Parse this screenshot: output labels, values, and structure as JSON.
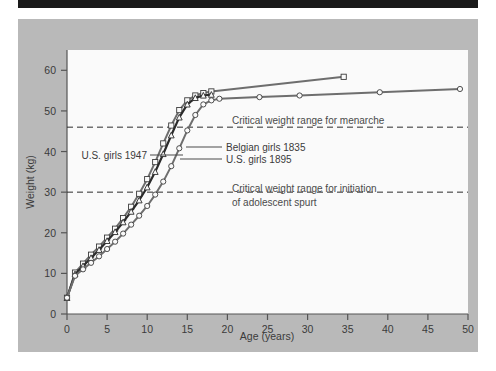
{
  "figure": {
    "background_color": "#b9b9b9",
    "plot_background_color": "#fafafa",
    "top_rule_color": "#1a1a1a"
  },
  "chart_data": {
    "type": "line",
    "title": "",
    "xlabel": "Age (years)",
    "ylabel": "Weight (kg)",
    "xlim": [
      0,
      50
    ],
    "ylim": [
      0,
      65
    ],
    "xticks": [
      0,
      5,
      10,
      15,
      20,
      25,
      30,
      35,
      40,
      45,
      50
    ],
    "xtick_labels": [
      "0",
      "5",
      "10",
      "15",
      "20",
      "25",
      "30",
      "35",
      "40",
      "45",
      "50"
    ],
    "yticks": [
      0,
      10,
      20,
      30,
      40,
      50,
      60
    ],
    "ytick_labels": [
      "0",
      "10",
      "20",
      "30",
      "40",
      "50",
      "60"
    ],
    "grid": false,
    "legend_position": "inline-leader-labels",
    "series": [
      {
        "name": "U.S. girls 1947",
        "marker": "square",
        "color": "#6e6e6e",
        "x": [
          0,
          1,
          2,
          3,
          4,
          5,
          6,
          7,
          8,
          9,
          10,
          11,
          12,
          13,
          14,
          15,
          16,
          17,
          18,
          34.5
        ],
        "y": [
          4.0,
          10.2,
          12.4,
          14.6,
          16.6,
          18.8,
          21.0,
          23.6,
          26.4,
          29.6,
          33.2,
          37.4,
          42.0,
          46.4,
          50.2,
          52.6,
          53.8,
          54.4,
          54.8,
          58.4
        ]
      },
      {
        "name": "Belgian girls 1835",
        "marker": "triangle",
        "color": "#2b2b2b",
        "x": [
          0,
          1,
          2,
          3,
          4,
          5,
          6,
          7,
          8,
          9,
          10,
          11,
          12,
          13,
          14,
          15,
          16,
          17,
          18
        ],
        "y": [
          4.0,
          9.8,
          11.8,
          13.8,
          15.8,
          18.0,
          20.2,
          22.6,
          25.2,
          28.0,
          31.2,
          35.0,
          39.4,
          44.0,
          48.4,
          51.6,
          53.2,
          53.8,
          54.0
        ]
      },
      {
        "name": "U.S. girls 1895",
        "marker": "circle",
        "color": "#6e6e6e",
        "x": [
          0,
          1,
          2,
          3,
          4,
          5,
          6,
          7,
          8,
          9,
          10,
          11,
          12,
          13,
          14,
          15,
          16,
          17,
          18,
          19,
          24,
          29,
          39,
          49
        ],
        "y": [
          4.0,
          9.4,
          11.0,
          12.6,
          14.2,
          16.0,
          17.8,
          19.8,
          22.0,
          24.2,
          26.6,
          29.4,
          32.6,
          36.4,
          40.8,
          45.2,
          49.0,
          51.6,
          52.6,
          53.0,
          53.4,
          53.8,
          54.6,
          55.4
        ]
      }
    ],
    "reference_lines": [
      {
        "id": "menarche",
        "y": 46,
        "style": "dashed",
        "label": "Critical weight range for menarche"
      },
      {
        "id": "adolescent-spurt",
        "y": 30,
        "style": "dashed",
        "label_line1": "Critical weight range for initiation",
        "label_line2": "of adolescent spurt"
      }
    ],
    "annotations": [
      {
        "id": "us-1947",
        "text": "U.S. girls 1947"
      },
      {
        "id": "belgian-1835",
        "text": "Belgian girls 1835"
      },
      {
        "id": "us-1895",
        "text": "U.S. girls 1895"
      }
    ]
  }
}
